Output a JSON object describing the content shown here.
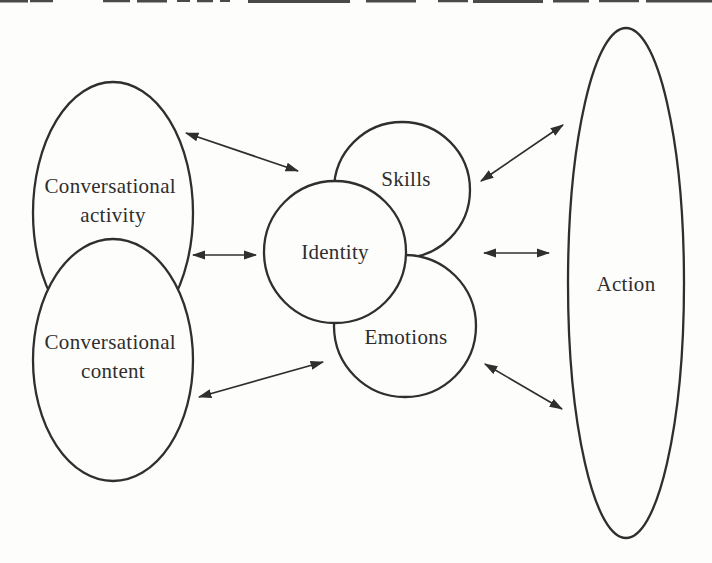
{
  "figure": {
    "type": "concept-diagram"
  },
  "nodes": {
    "activity": {
      "label": "Conversational activity",
      "line1": "Conversational",
      "line2": "activity"
    },
    "content": {
      "label": "Conversational content",
      "line1": "Conversational",
      "line2": "content"
    },
    "skills": {
      "label": "Skills"
    },
    "identity": {
      "label": "Identity"
    },
    "emotions": {
      "label": "Emotions"
    },
    "action": {
      "label": "Action"
    }
  },
  "edges": [
    {
      "from": "Conversational activity",
      "to": "Skills",
      "bidirectional": true
    },
    {
      "from": "Conversational activity / Conversational content",
      "to": "Identity",
      "bidirectional": true
    },
    {
      "from": "Conversational content",
      "to": "Emotions",
      "bidirectional": true
    },
    {
      "from": "Skills",
      "to": "Action",
      "bidirectional": true
    },
    {
      "from": "Identity",
      "to": "Action",
      "bidirectional": true
    },
    {
      "from": "Emotions",
      "to": "Action",
      "bidirectional": true
    }
  ],
  "colors": {
    "ink": "#2f2f2f",
    "background": "#fdfdfc"
  }
}
